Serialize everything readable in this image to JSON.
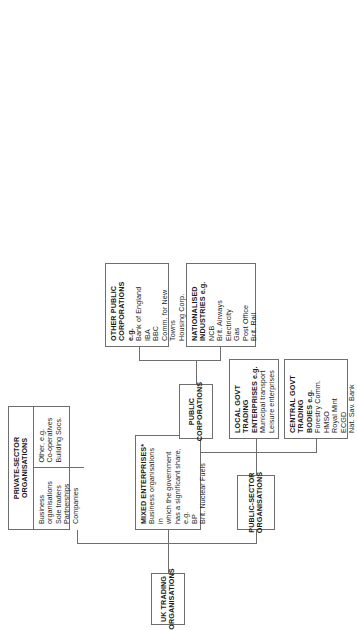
{
  "diagram": {
    "orientation": "landscape-rotated-90-ccw",
    "line_color": "#6e6e6e",
    "background": "#ffffff"
  },
  "nodes": {
    "root": {
      "heading": "UK TRADING\nORGANISATIONS"
    },
    "public_sector": {
      "heading": "PUBLIC-SECTOR\nORGANISATIONS"
    },
    "mixed_enterprises": {
      "heading": "MIXED ENTERPRISES*",
      "body": "Business organisations in\nwhich the government\nhas a significant share, e.g.\nBP\nBrit. Nuclear Fuels"
    },
    "private_sector": {
      "heading": "PRIVATE-SECTOR\nORGANISATIONS",
      "cell_left": "Business organisations\nSole traders\nPartnerships\nCompanies",
      "cell_right": "Other, e.g.\nCo-operatives\nBuilding Socs."
    },
    "central_govt": {
      "heading": "CENTRAL GOVT\nTRADING\nBODIES e.g.",
      "body": "Forestry Comm.\nHMSO\nRoyal Mint\nECGD\nNat. Sav. Bank"
    },
    "local_govt": {
      "heading": "LOCAL GOVT\nTRADING\nENTERPRISES e.g.",
      "body": "Municipal transport\nLeisure enterprises"
    },
    "public_corporations": {
      "heading": "PUBLIC\nCORPORATIONS"
    },
    "nationalised_industries": {
      "heading": "NATIONALISED\nINDUSTRIES e.g.",
      "body": "NCB\nBrit. Airways\nElectricity\nGas\nPost Office\nBrit. Rail"
    },
    "other_public_corporations": {
      "heading": "OTHER PUBLIC\nCORPORATIONS e.g.",
      "body": "Bank of England\nIBA\nBBC\nComm. for New Towns\nHousing Corp."
    }
  }
}
